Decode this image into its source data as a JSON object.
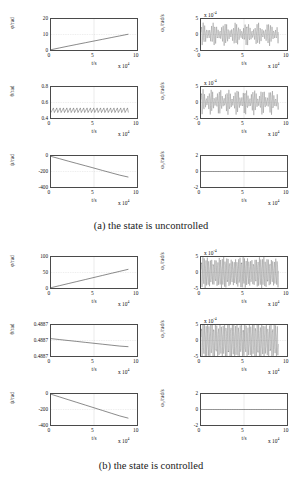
{
  "figure": {
    "background": "#ffffff",
    "axis_color": "#4a4a4a",
    "grid_color": "#b9b9b9",
    "line_color": "#3a3a3a"
  },
  "subfigures": [
    {
      "id": "a",
      "caption": "(a) the state is uncontrolled",
      "panels": [
        {
          "id": "phi-uncontrolled",
          "ytitle": "φ/rad",
          "yticks": [
            "20",
            "10",
            "0"
          ],
          "ylim": [
            0,
            20
          ],
          "xticks": [
            "0",
            "5",
            "10"
          ],
          "xlim": [
            0,
            10
          ],
          "xtitle": "t/s",
          "xexp_prefix": "x 10",
          "xexp_sup": "4",
          "yexp_prefix": "",
          "yexp_sup": "",
          "series_type": "line",
          "x": [
            0,
            1,
            2,
            3,
            4,
            5,
            6,
            7,
            8,
            9
          ],
          "y": [
            0.2,
            1.35,
            2.5,
            3.6,
            4.7,
            5.8,
            6.9,
            8.0,
            9.1,
            10.2
          ]
        },
        {
          "id": "omega1-uncontrolled",
          "ytitle": "ω₁/rad/s",
          "yticks": [
            "5",
            "0",
            "-5"
          ],
          "ylim": [
            -5,
            5
          ],
          "xticks": [
            "0",
            "5",
            "10"
          ],
          "xlim": [
            0,
            10
          ],
          "xtitle": "t/s",
          "xexp_prefix": "x 10",
          "xexp_sup": "4",
          "yexp_prefix": "x 10",
          "yexp_sup": "-4",
          "series_type": "oscillation",
          "amplitude": 2.0,
          "beat_amplitude": 1.0,
          "cycles": 46,
          "beat_cycles": 7,
          "mean": 0.1,
          "x_end_frac": 0.9
        },
        {
          "id": "theta-uncontrolled",
          "ytitle": "θ/rad",
          "yticks": [
            "0.8",
            "0.6",
            "0.4"
          ],
          "ylim": [
            0.4,
            0.8
          ],
          "xticks": [
            "0",
            "5",
            "10"
          ],
          "xlim": [
            0,
            10
          ],
          "xtitle": "t/s",
          "xexp_prefix": "x 10",
          "xexp_sup": "4",
          "yexp_prefix": "",
          "yexp_sup": "",
          "series_type": "sawtooth",
          "base": 0.47,
          "peak": 0.53,
          "cycles": 23,
          "x_end_frac": 0.9
        },
        {
          "id": "omega2-uncontrolled",
          "ytitle": "ω₂/rad/s",
          "yticks": [
            "5",
            "0",
            "-5"
          ],
          "ylim": [
            -5,
            5
          ],
          "xticks": [
            "0",
            "5",
            "10"
          ],
          "xlim": [
            0,
            10
          ],
          "xtitle": "t/s",
          "xexp_prefix": "x 10",
          "xexp_sup": "4",
          "yexp_prefix": "x 10",
          "yexp_sup": "-4",
          "series_type": "oscillation",
          "amplitude": 2.2,
          "beat_amplitude": 1.2,
          "cycles": 48,
          "beat_cycles": 9,
          "mean": 0.25,
          "x_end_frac": 0.9
        },
        {
          "id": "psi-uncontrolled",
          "ytitle": "ψ/rad",
          "yticks": [
            "0",
            "-200",
            "-400"
          ],
          "ylim": [
            -400,
            0
          ],
          "xticks": [
            "0",
            "5",
            "10"
          ],
          "xlim": [
            0,
            10
          ],
          "xtitle": "t/s",
          "xexp_prefix": "x 10",
          "xexp_sup": "4",
          "yexp_prefix": "",
          "yexp_sup": "",
          "series_type": "line",
          "x": [
            0,
            1,
            2,
            3,
            4,
            5,
            6,
            7,
            8,
            9
          ],
          "y": [
            -5,
            -35,
            -66,
            -96,
            -126,
            -156,
            -187,
            -217,
            -247,
            -272
          ]
        },
        {
          "id": "omega3-uncontrolled",
          "ytitle": "ω₃/rad/s",
          "yticks": [
            "2",
            "0",
            "-2"
          ],
          "ylim": [
            -2,
            2
          ],
          "xticks": [
            "0",
            "5",
            "10"
          ],
          "xlim": [
            0,
            10
          ],
          "xtitle": "t/s",
          "xexp_prefix": "x 10",
          "xexp_sup": "4",
          "yexp_prefix": "",
          "yexp_sup": "",
          "series_type": "flat",
          "value": 0,
          "x_end_frac": 1.0
        }
      ]
    },
    {
      "id": "b",
      "caption": "(b) the state is controlled",
      "panels": [
        {
          "id": "phi-controlled",
          "ytitle": "φ/rad",
          "yticks": [
            "100",
            "50",
            "0"
          ],
          "ylim": [
            0,
            100
          ],
          "xticks": [
            "0",
            "5",
            "10"
          ],
          "xlim": [
            0,
            10
          ],
          "xtitle": "t/s",
          "xexp_prefix": "x 10",
          "xexp_sup": "4",
          "yexp_prefix": "",
          "yexp_sup": "",
          "series_type": "line",
          "x": [
            0,
            1,
            2,
            3,
            4,
            5,
            6,
            7,
            8,
            9
          ],
          "y": [
            1,
            7.6,
            14.2,
            20.8,
            27.4,
            34,
            40.6,
            47.2,
            53.8,
            60.4
          ]
        },
        {
          "id": "omega1-controlled",
          "ytitle": "ω₁/rad/s",
          "yticks": [
            "5",
            "0",
            "-5"
          ],
          "ylim": [
            -5,
            5
          ],
          "xticks": [
            "0",
            "5",
            "10"
          ],
          "xlim": [
            0,
            10
          ],
          "xtitle": "t/s",
          "xexp_prefix": "x 10",
          "xexp_sup": "4",
          "yexp_prefix": "x 10",
          "yexp_sup": "-4",
          "series_type": "oscillation",
          "amplitude": 3.6,
          "beat_amplitude": 0.4,
          "cycles": 52,
          "beat_cycles": 4,
          "mean": 0.0,
          "x_end_frac": 0.9
        },
        {
          "id": "theta-controlled",
          "ytitle": "θ/rad",
          "yticks": [
            "0.4887",
            "0.4887",
            "0.4887"
          ],
          "ylim": [
            0,
            1
          ],
          "xticks": [
            "0",
            "5",
            "10"
          ],
          "xlim": [
            0,
            10
          ],
          "xtitle": "t/s",
          "xexp_prefix": "x 10",
          "xexp_sup": "4",
          "yexp_prefix": "",
          "yexp_sup": "",
          "series_type": "line",
          "x": [
            0,
            1,
            2,
            3,
            4,
            5,
            6,
            7,
            8,
            9
          ],
          "y": [
            0.56,
            0.53,
            0.5,
            0.47,
            0.44,
            0.41,
            0.38,
            0.35,
            0.32,
            0.3
          ]
        },
        {
          "id": "omega2-controlled",
          "ytitle": "ω₂/rad/s",
          "yticks": [
            "5",
            "0",
            "-5"
          ],
          "ylim": [
            -5,
            5
          ],
          "xticks": [
            "0",
            "5",
            "10"
          ],
          "xlim": [
            0,
            10
          ],
          "xtitle": "t/s",
          "xexp_prefix": "x 10",
          "xexp_sup": "4",
          "yexp_prefix": "x 10",
          "yexp_sup": "-4",
          "series_type": "oscillation",
          "amplitude": 4.4,
          "beat_amplitude": 0.3,
          "cycles": 50,
          "beat_cycles": 3,
          "mean": 0.0,
          "x_end_frac": 0.9
        },
        {
          "id": "psi-controlled",
          "ytitle": "ψ/rad",
          "yticks": [
            "0",
            "-200",
            "-400"
          ],
          "ylim": [
            -400,
            0
          ],
          "xticks": [
            "0",
            "5",
            "10"
          ],
          "xlim": [
            0,
            10
          ],
          "xtitle": "t/s",
          "xexp_prefix": "x 10",
          "xexp_sup": "4",
          "yexp_prefix": "",
          "yexp_sup": "",
          "series_type": "line",
          "x": [
            0,
            1,
            2,
            3,
            4,
            5,
            6,
            7,
            8,
            9
          ],
          "y": [
            -3,
            -38,
            -73,
            -108,
            -143,
            -178,
            -213,
            -248,
            -283,
            -312
          ]
        },
        {
          "id": "omega3-controlled",
          "ytitle": "ω₃/rad/s",
          "yticks": [
            "2",
            "0",
            "-2"
          ],
          "ylim": [
            -2,
            2
          ],
          "xticks": [
            "0",
            "5",
            "10"
          ],
          "xlim": [
            0,
            10
          ],
          "xtitle": "t/s",
          "xexp_prefix": "x 10",
          "xexp_sup": "4",
          "yexp_prefix": "",
          "yexp_sup": "",
          "series_type": "flat",
          "value": 0,
          "x_end_frac": 1.0
        }
      ]
    }
  ],
  "chart_data": {
    "type": "line",
    "xlabel": "t/s (x 10^4)",
    "ylabel": "rad and rad/s",
    "grid": true,
    "legend": "none",
    "panels": [
      {
        "name": "(a) φ/rad",
        "x": [
          0,
          1,
          2,
          3,
          4,
          5,
          6,
          7,
          8,
          9
        ],
        "values": [
          0.2,
          1.35,
          2.5,
          3.6,
          4.7,
          5.8,
          6.9,
          8.0,
          9.1,
          10.2
        ],
        "ylim": [
          0,
          20
        ],
        "yticks": [
          0,
          10,
          20
        ]
      },
      {
        "name": "(a) ω₁/rad/s (x10^-4)",
        "x": [
          0,
          9
        ],
        "values": [
          0,
          0
        ],
        "ylim": [
          -5,
          5
        ],
        "yticks": [
          -5,
          0,
          5
        ],
        "note": "dense oscillation amplitude ~±2-3"
      },
      {
        "name": "(a) θ/rad",
        "x": [
          0,
          9
        ],
        "values": [
          0.47,
          0.53
        ],
        "ylim": [
          0.4,
          0.8
        ],
        "yticks": [
          0.4,
          0.6,
          0.8
        ],
        "note": "sawtooth between 0.47 and 0.53"
      },
      {
        "name": "(a) ω₂/rad/s (x10^-4)",
        "x": [
          0,
          9
        ],
        "values": [
          0,
          0
        ],
        "ylim": [
          -5,
          5
        ],
        "yticks": [
          -5,
          0,
          5
        ],
        "note": "dense oscillation amplitude ~±3"
      },
      {
        "name": "(a) ψ/rad",
        "x": [
          0,
          1,
          2,
          3,
          4,
          5,
          6,
          7,
          8,
          9
        ],
        "values": [
          -5,
          -35,
          -66,
          -96,
          -126,
          -156,
          -187,
          -217,
          -247,
          -272
        ],
        "ylim": [
          -400,
          0
        ],
        "yticks": [
          -400,
          -200,
          0
        ]
      },
      {
        "name": "(a) ω₃/rad/s",
        "x": [
          0,
          10
        ],
        "values": [
          0,
          0
        ],
        "ylim": [
          -2,
          2
        ],
        "yticks": [
          -2,
          0,
          2
        ]
      },
      {
        "name": "(b) φ/rad",
        "x": [
          0,
          1,
          2,
          3,
          4,
          5,
          6,
          7,
          8,
          9
        ],
        "values": [
          1,
          7.6,
          14.2,
          20.8,
          27.4,
          34,
          40.6,
          47.2,
          53.8,
          60.4
        ],
        "ylim": [
          0,
          100
        ],
        "yticks": [
          0,
          50,
          100
        ]
      },
      {
        "name": "(b) ω₁/rad/s (x10^-4)",
        "x": [
          0,
          9
        ],
        "values": [
          0,
          0
        ],
        "ylim": [
          -5,
          5
        ],
        "yticks": [
          -5,
          0,
          5
        ],
        "note": "dense oscillation amplitude ~±4"
      },
      {
        "name": "(b) θ/rad",
        "x": [
          0,
          9
        ],
        "values": [
          0.4887,
          0.4887
        ],
        "ylim": [
          0.4887,
          0.4887
        ],
        "yticks": [
          "0.4887",
          "0.4887",
          "0.4887"
        ],
        "note": "slight downward drift"
      },
      {
        "name": "(b) ω₂/rad/s (x10^-4)",
        "x": [
          0,
          9
        ],
        "values": [
          0,
          0
        ],
        "ylim": [
          -5,
          5
        ],
        "yticks": [
          -5,
          0,
          5
        ],
        "note": "dense oscillation amplitude ~±4.5"
      },
      {
        "name": "(b) ψ/rad",
        "x": [
          0,
          1,
          2,
          3,
          4,
          5,
          6,
          7,
          8,
          9
        ],
        "values": [
          -3,
          -38,
          -73,
          -108,
          -143,
          -178,
          -213,
          -248,
          -283,
          -312
        ],
        "ylim": [
          -400,
          0
        ],
        "yticks": [
          -400,
          -200,
          0
        ]
      },
      {
        "name": "(b) ω₃/rad/s",
        "x": [
          0,
          10
        ],
        "values": [
          0,
          0
        ],
        "ylim": [
          -2,
          2
        ],
        "yticks": [
          -2,
          0,
          2
        ]
      }
    ]
  }
}
